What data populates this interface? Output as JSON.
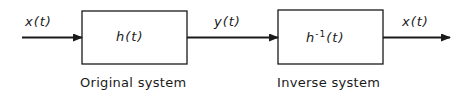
{
  "diagram": {
    "input_signal": "x(t)",
    "intermediate_signal": "y(t)",
    "output_signal": "x(t)",
    "blocks": [
      {
        "label": "h(t)",
        "caption": "Original system"
      },
      {
        "label_base": "h",
        "label_sup": "-1",
        "label_arg": "(t)",
        "caption": "Inverse system"
      }
    ],
    "colors": {
      "stroke": "#1a1a1a",
      "background": "#ffffff"
    }
  }
}
